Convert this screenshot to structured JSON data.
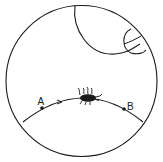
{
  "diagram": {
    "type": "hyperbolic-disk-geodesic",
    "colors": {
      "stroke": "#1a1a1a",
      "background": "#ffffff"
    },
    "points": [
      {
        "id": "A",
        "label": "A"
      },
      {
        "id": "B",
        "label": "B"
      }
    ],
    "elements": {
      "boundary_circle": "disk boundary",
      "geodesic": "arc from A to B",
      "direction_arrow": "arrow pointing toward B",
      "insect": "bug walking along geodesic",
      "large_arc": "geodesic arc near top",
      "small_arc": "small geodesic arc near top-right"
    }
  }
}
